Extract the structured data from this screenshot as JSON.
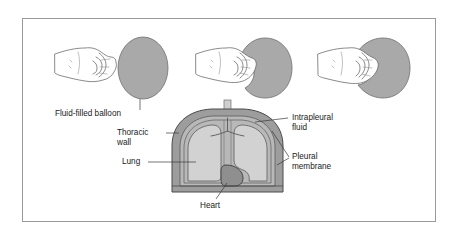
{
  "figure": {
    "frame": {
      "border_color": "#9a9a9a"
    },
    "colors": {
      "balloon_fill": "#a9a9a9",
      "balloon_stroke": "#6f6f6f",
      "thoracic_wall_fill": "#9d9d9d",
      "pleural_fluid_fill": "#b8b8b8",
      "lung_fill": "#d2d2d2",
      "heart_fill": "#8f8f8f",
      "trachea_fill": "#cfcfcf",
      "line_color": "#5e5e5e",
      "text_color": "#1a1a1a",
      "background": "#ffffff"
    },
    "panels": [
      {
        "name": "panel-uncompressed",
        "description": "Fist beside an undeformed fluid-filled balloon"
      },
      {
        "name": "panel-partial",
        "description": "Fist pressing partway into the balloon"
      },
      {
        "name": "panel-enveloped",
        "description": "Fist pressed deep so the balloon wraps around it"
      }
    ],
    "labels": {
      "balloon": {
        "text": "Fluid-filled balloon"
      },
      "thoracic_wall": {
        "line1": "Thoracic",
        "line2": "wall"
      },
      "lung": {
        "text": "Lung"
      },
      "heart": {
        "text": "Heart"
      },
      "intrapleural_fluid": {
        "line1": "Intrapleural",
        "line2": "fluid"
      },
      "pleural_membrane": {
        "line1": "Pleural",
        "line2": "membrane"
      }
    }
  }
}
